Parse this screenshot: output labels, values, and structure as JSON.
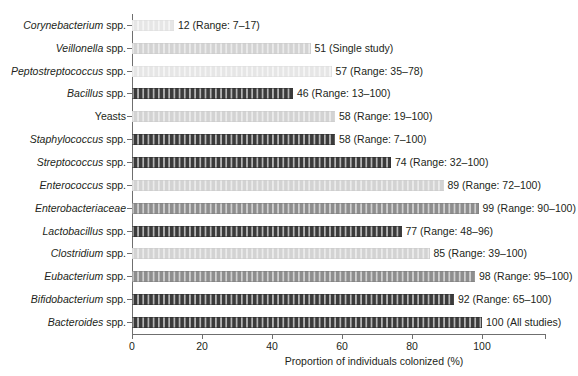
{
  "chart_data": {
    "type": "bar",
    "orientation": "horizontal",
    "title": "",
    "xlabel": "Proportion of individuals colonized (%)",
    "ylabel": "",
    "xlim": [
      0,
      118
    ],
    "xticks": [
      0,
      20,
      40,
      60,
      80,
      100
    ],
    "xticklabels": [
      "0",
      "20",
      "40",
      "60",
      "80",
      "100"
    ],
    "grid": false,
    "legend": null,
    "categories": [
      "Corynebacterium spp.",
      "Veillonella spp.",
      "Peptostreptococcus spp.",
      "Bacillus spp.",
      "Yeasts",
      "Staphylococcus spp.",
      "Streptococcus spp.",
      "Enterococcus spp.",
      "Enterobacteriaceae",
      "Lactobacillus spp.",
      "Clostridium spp.",
      "Eubacterium spp.",
      "Bifidobacterium spp.",
      "Bacteroides spp."
    ],
    "values": [
      12,
      51,
      57,
      46,
      58,
      58,
      74,
      89,
      99,
      77,
      85,
      98,
      92,
      100
    ],
    "annotations": [
      "12 (Range: 7–17)",
      "51 (Single study)",
      "57 (Range: 35–78)",
      "46 (Range: 13–100)",
      "58 (Range: 19–100)",
      "58 (Range: 7–100)",
      "74 (Range: 32–100)",
      "89 (Range: 72–100)",
      "99 (Range: 90–100)",
      "77 (Range: 48–96)",
      "85 (Range: 39–100)",
      "98 (Range: 95–100)",
      "92 (Range: 65–100)",
      "100 (All studies)"
    ]
  },
  "axis": {
    "xlabel": "Proportion of individuals colonized (%)",
    "tick_labels": [
      "0",
      "20",
      "40",
      "60",
      "80",
      "100"
    ]
  },
  "rows": [
    {
      "genus": "Corynebacterium",
      "suffix": " spp.",
      "italic_all": false,
      "value": 12,
      "label": "12 (Range: 7–17)",
      "shade": "pale"
    },
    {
      "genus": "Veillonella",
      "suffix": " spp.",
      "italic_all": false,
      "value": 51,
      "label": "51 (Single study)",
      "shade": "light"
    },
    {
      "genus": "Peptostreptococcus",
      "suffix": " spp.",
      "italic_all": false,
      "value": 57,
      "label": "57 (Range: 35–78)",
      "shade": "pale"
    },
    {
      "genus": "Bacillus",
      "suffix": " spp.",
      "italic_all": false,
      "value": 46,
      "label": "46 (Range: 13–100)",
      "shade": "dark"
    },
    {
      "genus": "Yeasts",
      "suffix": "",
      "italic_all": false,
      "value": 58,
      "label": "58 (Range: 19–100)",
      "shade": "light"
    },
    {
      "genus": "Staphylococcus",
      "suffix": " spp.",
      "italic_all": false,
      "value": 58,
      "label": "58 (Range: 7–100)",
      "shade": "dark"
    },
    {
      "genus": "Streptococcus",
      "suffix": " spp.",
      "italic_all": false,
      "value": 74,
      "label": "74 (Range: 32–100)",
      "shade": "dark"
    },
    {
      "genus": "Enterococcus",
      "suffix": " spp.",
      "italic_all": false,
      "value": 89,
      "label": "89 (Range: 72–100)",
      "shade": "light"
    },
    {
      "genus": "Enterobacteriaceae",
      "suffix": "",
      "italic_all": true,
      "value": 99,
      "label": "99 (Range: 90–100)",
      "shade": "mid"
    },
    {
      "genus": "Lactobacillus",
      "suffix": " spp.",
      "italic_all": false,
      "value": 77,
      "label": "77 (Range: 48–96)",
      "shade": "dark"
    },
    {
      "genus": "Clostridium",
      "suffix": " spp.",
      "italic_all": false,
      "value": 85,
      "label": "85 (Range: 39–100)",
      "shade": "light"
    },
    {
      "genus": "Eubacterium",
      "suffix": " spp.",
      "italic_all": false,
      "value": 98,
      "label": "98 (Range: 95–100)",
      "shade": "mid"
    },
    {
      "genus": "Bifidobacterium",
      "suffix": " spp.",
      "italic_all": false,
      "value": 92,
      "label": "92 (Range: 65–100)",
      "shade": "dark"
    },
    {
      "genus": "Bacteroides",
      "suffix": " spp.",
      "italic_all": false,
      "value": 100,
      "label": "100 (All studies)",
      "shade": "dark"
    }
  ],
  "colors": {
    "axis": "#6f6f6f",
    "text": "#231f20",
    "bar_dark": "#3b3b3b",
    "bar_mid": "#8e8e8e",
    "bar_light": "#d3d3d3",
    "bar_pale": "#e6e6e6",
    "background": "#ffffff"
  }
}
